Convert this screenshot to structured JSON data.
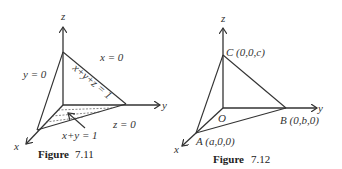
{
  "figures": [
    {
      "caption_bold": "Figure",
      "caption_num": "7.11",
      "axes": {
        "x": "x",
        "y": "y",
        "z": "z"
      },
      "labels": {
        "plane_y0": "y = 0",
        "plane_x0": "x = 0",
        "plane_z0": "z = 0",
        "plane_xyz": "x+y+z = 1",
        "line_xy": "x+y = 1"
      }
    },
    {
      "caption_bold": "Figure",
      "caption_num": "7.12",
      "axes": {
        "x": "x",
        "y": "y",
        "z": "z"
      },
      "points": {
        "origin": "O",
        "A": "A (a,0,0)",
        "B": "B (0,b,0)",
        "C": "C (0,0,c)"
      }
    }
  ]
}
